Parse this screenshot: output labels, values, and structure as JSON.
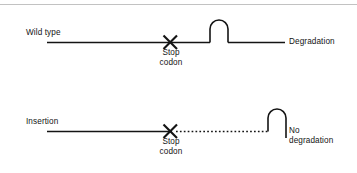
{
  "figure": {
    "title_rule_color": "#c2c2c2",
    "stroke_color": "#141414",
    "background": "#ffffff",
    "panels": [
      {
        "id": "wild-type",
        "row_label": "Wild type",
        "stop_codon_label": "Stop\ncodon",
        "stop_codon_line1": "Stop",
        "stop_codon_line2": "codon",
        "outcome_label": "Degradation",
        "transcript_style": "solid",
        "baseline_y": 42,
        "line_start_x": 47,
        "line_end_x": 285,
        "stop_codon_x": 170,
        "complex_x": 219
      },
      {
        "id": "insertion",
        "row_label": "Insertion",
        "stop_codon_label": "Stop\ncodon",
        "stop_codon_line1": "Stop",
        "stop_codon_line2": "codon",
        "outcome_label": "No degradation",
        "outcome_line1": "No",
        "outcome_line2": "degradation",
        "transcript_style": "solid-then-dotted",
        "baseline_y": 131,
        "line_start_x": 47,
        "line_end_x": 268,
        "stop_codon_x": 170,
        "complex_x": 276
      }
    ]
  }
}
